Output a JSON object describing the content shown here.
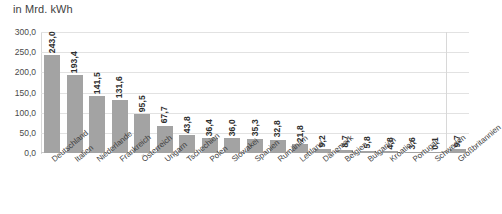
{
  "chart_data": {
    "type": "bar",
    "title": "in Mrd. kWh",
    "subtitle": "",
    "xlabel": "",
    "ylabel": "",
    "ylim": [
      0,
      300
    ],
    "yticks": [
      "0,0",
      "50,0",
      "100,0",
      "150,0",
      "200,0",
      "250,0",
      "300,0"
    ],
    "ytick_values": [
      0,
      50,
      100,
      150,
      200,
      250,
      300
    ],
    "grid": true,
    "legend": "none",
    "orientation": "vertical",
    "bar_color": "#a3a3a3",
    "grid_color": "#e2e2e2",
    "separator_before_index": 17,
    "categories": [
      "Deutschland",
      "Italien",
      "Niederlande",
      "Frankreich",
      "Österreich",
      "Ungarn",
      "Tschechien",
      "Polen",
      "Slowakei",
      "Spanien",
      "Rumänien",
      "Lettland",
      "Dänemark",
      "Belgien",
      "Bulgarien",
      "Kroatien",
      "Portugal",
      "Schweden",
      "Großbritannien"
    ],
    "values": [
      243.0,
      193.4,
      141.5,
      131.6,
      95.5,
      67.7,
      43.8,
      36.4,
      36.0,
      35.3,
      32.8,
      21.8,
      9.2,
      8.7,
      5.8,
      4.8,
      3.6,
      0.1,
      9.7
    ],
    "value_labels": [
      "243,0",
      "193,4",
      "141,5",
      "131,6",
      "95,5",
      "67,7",
      "43,8",
      "36,4",
      "36,0",
      "35,3",
      "32,8",
      "21,8",
      "9,2",
      "8,7",
      "5,8",
      "4,8",
      "3,6",
      "0,1",
      "9,7"
    ]
  }
}
